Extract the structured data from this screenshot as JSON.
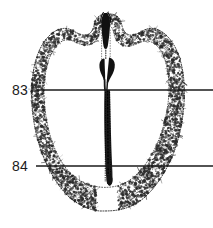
{
  "figure": {
    "type": "anatomical-cross-section",
    "width": 213,
    "height": 228,
    "background_color": "#ffffff",
    "ink_color": "#1a1a1a",
    "stipple_color": "#2b2b2b"
  },
  "section_lines": [
    {
      "label": "83",
      "label_x": 12,
      "label_y": 83,
      "line_y": 90,
      "line_x_start": 36,
      "line_x_end": 213,
      "line_color": "#1a1a1a",
      "line_width": 1.6
    },
    {
      "label": "84",
      "label_x": 12,
      "label_y": 159,
      "line_y": 166,
      "line_x_start": 36,
      "line_x_end": 213,
      "line_color": "#1a1a1a",
      "line_width": 1.6
    }
  ],
  "specimen": {
    "outline_name": "specimen-outline",
    "midline_structure_name": "midline-dark-band",
    "top_structure_name": "superior-dark-process",
    "mid_structure_name": "bifurcated-dark-body",
    "outline_path": "M 106 14 C 99 14 95 19 94 26 C 92 33 88 36 83 35 C 77 34 73 30 69 29 C 62 27 55 30 49 36 C 42 43 38 52 35 63 C 32 76 31 90 32 104 C 33 120 36 137 42 153 C 48 169 56 183 66 194 C 76 204 88 210 100 211 C 106 211 112 211 118 210 C 130 208 141 202 150 192 C 160 181 168 167 174 152 C 180 136 183 119 184 103 C 185 89 184 75 181 63 C 178 52 174 43 167 36 C 161 30 154 27 147 29 C 143 30 139 34 133 35 C 128 36 124 33 122 26 C 121 19 117 14 110 14 Z",
    "cortex_inner_path": "M 106 24 C 102 24 100 28 99 34 C 97 42 91 46 84 45 C 78 44 74 41 70 40 C 64 39 59 42 55 48 C 49 56 46 66 45 78 C 43 92 44 107 47 122 C 50 138 55 152 63 164 C 70 175 80 182 90 185 C 97 187 104 188 111 187 C 122 186 132 180 140 171 C 149 161 156 148 161 134 C 166 119 169 103 169 88 C 169 75 167 64 163 55 C 159 46 153 41 146 41 C 141 41 136 45 130 46 C 122 47 116 43 114 34 C 113 28 110 24 106 24 Z"
  },
  "stipple": {
    "seed": 20240517,
    "dot_count": 2400,
    "dot_min_radius": 0.35,
    "dot_max_radius": 1.5
  }
}
